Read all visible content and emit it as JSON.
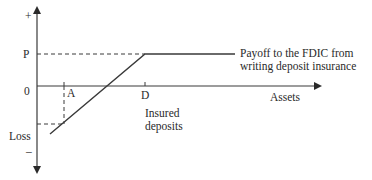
{
  "diagram": {
    "y_axis": {
      "top_sign": "+",
      "bottom_sign": "–",
      "origin": "0",
      "p_label": "P",
      "loss_label": "Loss"
    },
    "x_axis": {
      "label": "Assets",
      "tick_a": "A",
      "tick_d": "D"
    },
    "annotations": {
      "payoff_line1": "Payoff to the FDIC from",
      "payoff_line2": "writing deposit insurance",
      "insured_line1": "Insured",
      "insured_line2": "deposits"
    },
    "colors": {
      "line": "#3a3a3a",
      "text": "#2a2a2a"
    }
  }
}
